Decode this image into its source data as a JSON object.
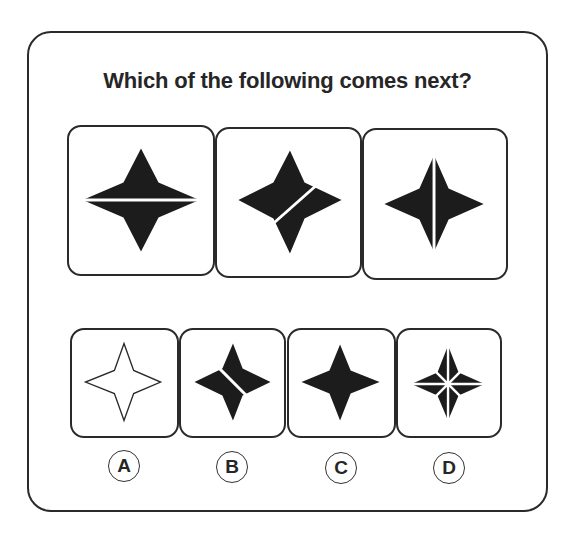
{
  "question": {
    "title": "Which of the following comes next?"
  },
  "sequence": [
    {
      "index": 1,
      "shape": "filled-four-point-star",
      "line": "horizontal"
    },
    {
      "index": 2,
      "shape": "filled-four-point-star",
      "line": "diagonal-bottom-left-to-top-right"
    },
    {
      "index": 3,
      "shape": "filled-four-point-star",
      "line": "vertical"
    }
  ],
  "options": [
    {
      "label": "A",
      "shape": "outline-four-point-star",
      "line": "none"
    },
    {
      "label": "B",
      "shape": "filled-four-point-star",
      "line": "diagonal-top-left-to-bottom-right"
    },
    {
      "label": "C",
      "shape": "filled-four-point-star",
      "line": "none"
    },
    {
      "label": "D",
      "shape": "filled-four-point-star",
      "line": "horizontal-vertical-and-both-diagonals"
    }
  ],
  "colors": {
    "shape_fill": "#1c1c1c",
    "border": "#2a2a2a",
    "background": "#ffffff"
  }
}
